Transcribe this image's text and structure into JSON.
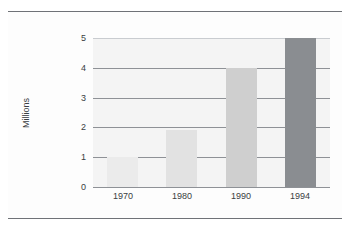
{
  "chart_data": {
    "type": "bar",
    "title": "",
    "subtitle": "",
    "xlabel": "",
    "ylabel": "Millions",
    "categories": [
      "1970",
      "1980",
      "1990",
      "1994"
    ],
    "values": [
      1.0,
      1.9,
      4.0,
      5.0
    ],
    "ylim": [
      0,
      5
    ],
    "yticks": [
      "0",
      "1",
      "2",
      "3",
      "4",
      "5"
    ],
    "ytick_values": [
      0,
      1,
      2,
      3,
      4,
      5
    ],
    "grid": "horizontal",
    "legend": "none",
    "bar_colors": [
      "#ebebeb",
      "#e2e2e2",
      "#cfcfcf",
      "#8a8d91"
    ],
    "plot_background": "#f4f4f4",
    "gridline_color": "#8e9196",
    "axis_text_color": "#3a3d42",
    "frame_rule_color": "#6f7277"
  }
}
